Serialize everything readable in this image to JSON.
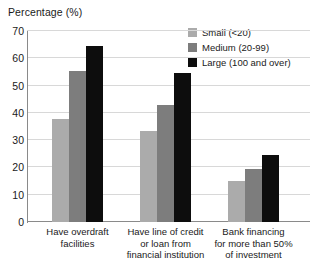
{
  "chart_data": {
    "type": "bar",
    "title": "Percentage (%)",
    "xlabel": "",
    "ylabel": "",
    "ylim": [
      0,
      70
    ],
    "yticks": [
      0,
      10,
      20,
      30,
      40,
      50,
      60,
      70
    ],
    "ytick_labels": [
      "0",
      "10",
      "20",
      "30",
      "40",
      "50",
      "60",
      "70"
    ],
    "grid": true,
    "legend_position": "top-right",
    "categories": [
      "Have overdraft facilities",
      "Have line of credit or loan from financial institution",
      "Bank financing for more than 50% of investment"
    ],
    "category_lines": [
      [
        "Have overdraft",
        "facilities"
      ],
      [
        "Have line of credit",
        "or loan from",
        "financial institution"
      ],
      [
        "Bank financing",
        "for more than 50%",
        "of investment"
      ]
    ],
    "series": [
      {
        "name": "Small (<20)",
        "color": "#ababab",
        "values": [
          37.7,
          33.5,
          15.0
        ]
      },
      {
        "name": "Medium (20-99)",
        "color": "#7d7d7d",
        "values": [
          55.3,
          43.0,
          19.3
        ]
      },
      {
        "name": "Large (100 and over)",
        "color": "#0d0d0d",
        "values": [
          64.5,
          54.5,
          24.5
        ]
      }
    ]
  },
  "colors": {
    "grid": "#d8d8d8",
    "axis": "#8a8a8a",
    "text": "#1a1a1a",
    "background": "#ffffff"
  }
}
